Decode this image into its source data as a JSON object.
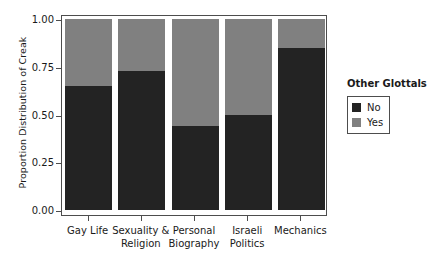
{
  "chart_data": {
    "type": "bar",
    "subtype": "stacked-100-percent",
    "title": "",
    "xlabel": "",
    "ylabel": "Proportion Distribution of Creak",
    "ylim": [
      0.0,
      1.0
    ],
    "yticks": [
      "0.00",
      "0.25",
      "0.50",
      "0.75",
      "1.00"
    ],
    "ytick_values": [
      0.0,
      0.25,
      0.5,
      0.75,
      1.0
    ],
    "grid": false,
    "categories": [
      "Gay Life",
      "Sexuality & Religion",
      "Personal Biography",
      "Israeli Politics",
      "Mechanics"
    ],
    "category_lines": [
      [
        "Gay Life"
      ],
      [
        "Sexuality &",
        "Religion"
      ],
      [
        "Personal",
        "Biography"
      ],
      [
        "Israeli",
        "Politics"
      ],
      [
        "Mechanics"
      ]
    ],
    "legend": {
      "title": "Other Glottals",
      "position": "right",
      "entries": [
        {
          "label": "No",
          "color": "#232323"
        },
        {
          "label": "Yes",
          "color": "#808080"
        }
      ]
    },
    "series": [
      {
        "name": "No",
        "color": "#232323",
        "values": [
          0.65,
          0.73,
          0.44,
          0.5,
          0.85
        ]
      },
      {
        "name": "Yes",
        "color": "#808080",
        "values": [
          0.35,
          0.27,
          0.56,
          0.5,
          0.15
        ]
      }
    ]
  }
}
